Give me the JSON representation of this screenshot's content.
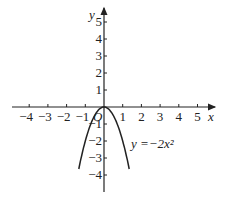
{
  "chart_data": {
    "type": "line",
    "title": "",
    "function_label": "y =−2x²",
    "xlabel": "x",
    "ylabel": "y",
    "origin_label": "O",
    "xlim": [
      -4.5,
      5.8
    ],
    "ylim": [
      -4.8,
      5.5
    ],
    "x_ticks": [
      -4,
      -3,
      -2,
      -1,
      1,
      2,
      3,
      4,
      5
    ],
    "y_ticks": [
      -4,
      -3,
      -2,
      -1,
      1,
      2,
      3,
      4,
      5
    ],
    "series": [
      {
        "name": "y = -2x^2",
        "x": [
          -1.35,
          -1,
          -0.5,
          0,
          0.5,
          1,
          1.35
        ],
        "y": [
          -3.65,
          -2,
          -0.5,
          0,
          -0.5,
          -2,
          -3.65
        ]
      }
    ],
    "grid": false
  },
  "layout": {
    "origin_px": [
      104,
      107
    ],
    "unit_x_px": 18.7,
    "unit_y_px": 17,
    "color": "#222222"
  }
}
